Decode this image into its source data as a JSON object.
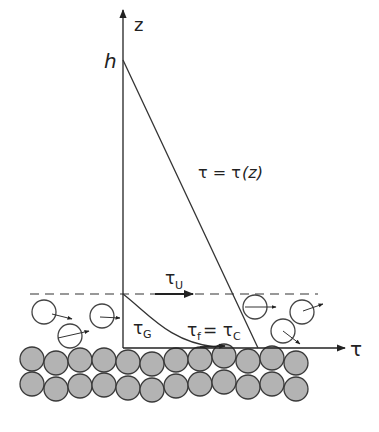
{
  "diagram": {
    "type": "shear-stress-profile-over-granular-bed",
    "axes": {
      "vertical_label": "z",
      "horizontal_label": "τ",
      "height_marker": "h"
    },
    "labels": {
      "profile_eq_lhs": "τ = τ",
      "profile_eq_rhs": "(z)",
      "upper_stress": "τ",
      "upper_stress_sub": "U",
      "grain_stress": "τ",
      "grain_stress_sub": "G",
      "fluid_stress": "τ",
      "fluid_stress_sub": "f",
      "equals": " = τ",
      "critical_sub": "C"
    },
    "colors": {
      "line": "#333333",
      "bed_grain_fill": "#b3b3b3",
      "bed_grain_stroke": "#3a3a3a",
      "dashed_line": "#777777"
    }
  }
}
